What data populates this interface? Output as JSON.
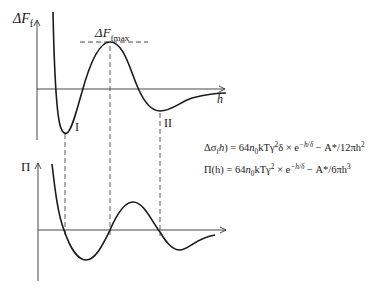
{
  "figure": {
    "top_panel": {
      "y_axis_label": "ΔF",
      "y_axis_label_sub": "f",
      "x_axis_label": "h",
      "max_label": "ΔF",
      "max_label_sub": "fmax",
      "minimum_labels": [
        "I",
        "II"
      ]
    },
    "bottom_panel": {
      "y_axis_label": "Π"
    },
    "equations": {
      "eq1": {
        "lhs": "Δσ",
        "lhs_sub": "f",
        "lhs_arg": "(h) = 64",
        "n": "n",
        "n_sub": "0",
        "mid": "kTγ",
        "mid_sup": "2",
        "tail": "δ × e",
        "exp": "−h/δ",
        "rest": " − A*/12πh",
        "rest_sup": "2"
      },
      "eq2": {
        "lhs": "Π(h) = 64",
        "n": "n",
        "n_sub": "0",
        "mid": "kTγ",
        "mid_sup": "2",
        "tail": " × e",
        "exp": "−h/δ",
        "rest": " − A*/6πh",
        "rest_sup": "3"
      }
    },
    "colors": {
      "line": "#1a1a1a",
      "axis": "#333333"
    }
  }
}
